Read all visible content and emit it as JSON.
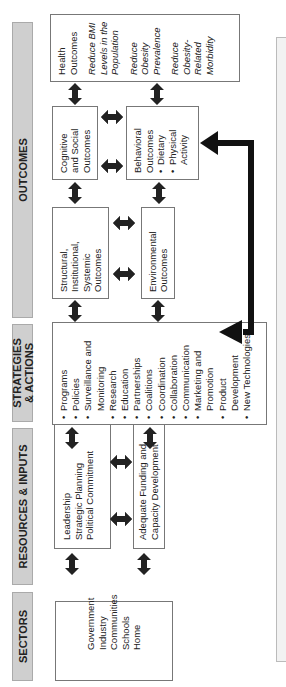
{
  "headers": {
    "outcomes": "OUTCOMES",
    "strategies": "STRATEGIES & ACTIONS",
    "resources": "RESOURCES & INPUTS",
    "sectors": "SECTORS"
  },
  "sectors": {
    "items": [
      "Government",
      "Industry",
      "Communities",
      "Schools",
      "Home"
    ]
  },
  "resources": {
    "leadership": [
      "Leadership",
      "Strategic Planning",
      "Political Commitment"
    ],
    "funding": [
      "Adequate Funding and",
      "Capacity Development"
    ]
  },
  "strategies": {
    "items": [
      "Programs",
      "Policies",
      "Surveillance and Monitoring",
      "Research",
      "Education",
      "Partnerships",
      "Coalitions",
      "Coordination",
      "Collaboration",
      "Communication",
      "Marketing and Promotion",
      "Product Development",
      "New Technologies"
    ]
  },
  "outcomes": {
    "structural": "Structural, Institutional, Systemic Outcomes",
    "environmental": "Environmental Outcomes",
    "cognitive": "Cognitive and Social Outcomes",
    "behavioral": {
      "title": "Behavioral Outcomes",
      "items": [
        "Dietary",
        "Physical Activity"
      ]
    },
    "health": {
      "title": "Health Outcomes",
      "goals": [
        "Reduce BMI Levels in the Population",
        "Reduce Obesity Prevalence",
        "Reduce Obesity-Related Morbidity"
      ]
    }
  }
}
